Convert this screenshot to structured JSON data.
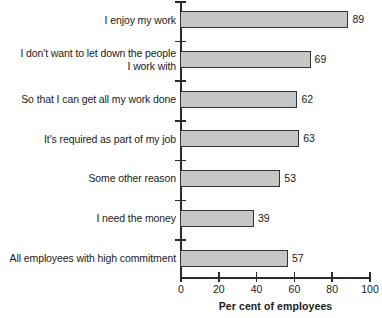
{
  "chart_data": {
    "type": "bar",
    "orientation": "horizontal",
    "title": "",
    "xlabel": "Per cent of employees",
    "ylabel": "",
    "xlim": [
      0,
      100
    ],
    "xticks": [
      0,
      20,
      40,
      60,
      80,
      100
    ],
    "xtick_labels": [
      "0",
      "20",
      "40",
      "60",
      "80",
      "100"
    ],
    "grid": false,
    "legend": null,
    "categories": [
      "I enjoy my work",
      "I don't want to let down the people I work with",
      "So that I can get all my work done",
      "It's required as part of my job",
      "Some other reason",
      "I need the money",
      "All employees with high commitment"
    ],
    "category_lines": [
      [
        "I enjoy my work"
      ],
      [
        "I don't want to let down the people",
        "I work with"
      ],
      [
        "So that I can get all my work done"
      ],
      [
        "It's required as part of my job"
      ],
      [
        "Some other reason"
      ],
      [
        "I need the money"
      ],
      [
        "All employees with high commitment"
      ]
    ],
    "values": [
      89,
      69,
      62,
      63,
      53,
      39,
      57
    ],
    "value_labels": [
      "89",
      "69",
      "62",
      "63",
      "53",
      "39",
      "57"
    ],
    "colors": {
      "bar_fill": "#c6c6c6",
      "bar_stroke": "#333333",
      "axis": "#2b2b2b",
      "text": "#1a1a1a",
      "background": "#ffffff"
    }
  }
}
